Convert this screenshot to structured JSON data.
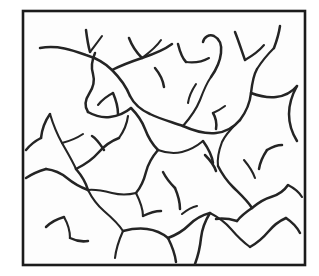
{
  "figure": {
    "description": "Scanned black line drawing of a dense dendritic / crack network enclosed in a thin rectangular frame",
    "style": "black-and-white line art",
    "background_color": "#ffffff",
    "stroke_color": "#242424",
    "frame_color": "#1b1b1b",
    "frame_fill": "#fdfdfd",
    "canvas": {
      "width": 319,
      "height": 276
    },
    "frame": {
      "name": "plot-frame",
      "x": 23,
      "y": 11,
      "width": 282,
      "height": 254,
      "stroke_width": 2.6
    },
    "network": {
      "type": "dendritic-line-network",
      "stroke_width": 2.5,
      "branch_count": 46,
      "paths": [
        "M 40 48 C 58 45, 72 50, 86 55 C 96 58, 104 62, 112 70 C 120 78, 126 86, 130 96",
        "M 86 30 C 87 38, 88 45, 90 52",
        "M 102 36 C 97 43, 93 48, 90 52",
        "M 130 96 C 134 104, 141 110, 150 114 C 160 119, 172 122, 183 126",
        "M 112 70 C 120 66, 130 62, 142 58 C 154 54, 164 50, 172 44",
        "M 142 58 C 150 52, 157 46, 161 40",
        "M 129 38 C 132 46, 136 52, 142 58",
        "M 95 53 C 92 60, 91 68, 93 74 C 95 81, 93 88, 89 94 C 85 100, 84 106, 88 112",
        "M 183 126 C 190 118, 196 110, 200 100 C 203 92, 206 84, 211 77",
        "M 211 77 C 216 70, 220 62, 221 53 C 222 45, 220 39, 214 36 C 209 34, 204 37, 203 42",
        "M 178 44 C 180 52, 182 58, 186 62",
        "M 186 62 C 194 63, 202 62, 209 58",
        "M 183 126 C 194 131, 205 134, 216 133 C 226 132, 234 127, 240 120",
        "M 240 120 C 246 112, 250 103, 251 93 C 252 84, 253 76, 257 69",
        "M 257 69 C 262 61, 268 54, 274 48",
        "M 251 93 C 259 96, 267 98, 276 97 C 285 96, 292 92, 297 86",
        "M 235 32 C 239 42, 242 52, 245 60",
        "M 245 60 C 252 56, 259 51, 264 45",
        "M 274 48 C 277 40, 279 33, 280 26",
        "M 297 86 C 292 95, 289 104, 289 114 C 289 124, 292 133, 297 141",
        "M 240 120 C 233 127, 226 133, 222 142 C 219 150, 217 158, 218 166",
        "M 218 166 C 222 174, 227 181, 233 187 C 240 194, 247 200, 252 208",
        "M 213 113 C 216 118, 217 123, 216 129",
        "M 225 106 C 221 109, 218 111, 213 113",
        "M 88 112 C 95 116, 102 118, 110 117 C 118 116, 125 113, 131 108",
        "M 131 108 C 137 114, 142 121, 145 129 C 148 137, 152 144, 158 150",
        "M 158 150 C 166 153, 174 154, 182 152 C 190 150, 197 146, 203 141",
        "M 203 141 C 208 148, 212 155, 213 163",
        "M 158 150 C 152 157, 148 164, 146 172 C 144 180, 141 187, 136 193",
        "M 136 193 C 128 195, 120 195, 112 193 C 104 191, 96 189, 88 190",
        "M 88 190 C 80 187, 73 183, 67 178 C 61 173, 54 170, 46 169",
        "M 46 169 C 39 171, 32 174, 26 178",
        "M 50 114 C 53 124, 57 134, 62 143 C 67 152, 72 160, 76 169",
        "M 50 114 C 45 121, 42 129, 41 138",
        "M 76 169 C 84 165, 92 160, 98 153 C 104 146, 111 141, 119 138",
        "M 119 138 C 124 131, 127 124, 128 116",
        "M 104 150 C 100 144, 97 139, 92 136",
        "M 76 169 C 82 176, 86 183, 88 190",
        "M 88 190 C 92 198, 97 205, 104 211 C 111 217, 118 223, 123 231",
        "M 123 231 C 131 229, 139 228, 147 229 C 155 230, 162 233, 168 238",
        "M 168 238 C 176 235, 183 231, 189 225 C 195 219, 202 215, 210 213",
        "M 210 213 C 218 217, 225 222, 231 229 C 237 236, 243 242, 250 247",
        "M 250 247 C 257 243, 263 238, 268 232 C 273 226, 279 221, 286 218",
        "M 286 218 C 292 222, 297 227, 300 233",
        "M 123 231 C 119 240, 116 249, 115 258",
        "M 210 213 C 205 221, 202 229, 201 238 C 200 248, 198 256, 195 264",
        "M 252 208 C 258 203, 264 199, 271 197 C 278 195, 284 191, 288 185",
        "M 288 185 C 294 188, 299 192, 302 197",
        "M 252 208 C 246 212, 241 216, 237 221",
        "M 237 221 C 230 219, 223 218, 216 219",
        "M 64 217 C 68 224, 70 231, 70 238",
        "M 64 217 C 57 219, 51 222, 46 227",
        "M 70 238 C 76 241, 82 242, 88 241",
        "M 136 193 C 140 201, 143 208, 143 216",
        "M 143 216 C 149 213, 155 211, 161 211",
        "M 113 93 C 116 100, 118 107, 118 114",
        "M 113 93 C 107 96, 102 100, 98 105",
        "M 175 188 C 178 195, 180 202, 180 209",
        "M 175 188 C 170 183, 166 178, 163 172",
        "M 182 214 C 187 210, 192 207, 197 206",
        "M 155 68 C 160 74, 163 80, 164 87",
        "M 205 155 C 210 160, 214 165, 216 171",
        "M 62 143 C 70 141, 77 138, 83 134",
        "M 41 138 C 35 141, 30 145, 26 150",
        "M 168 238 C 172 246, 175 254, 176 262",
        "M 196 84 C 192 90, 189 96, 188 103",
        "M 267 150 C 263 156, 260 162, 259 169",
        "M 267 150 C 272 147, 277 145, 282 145",
        "M 244 160 C 249 166, 253 172, 255 178"
      ]
    }
  }
}
